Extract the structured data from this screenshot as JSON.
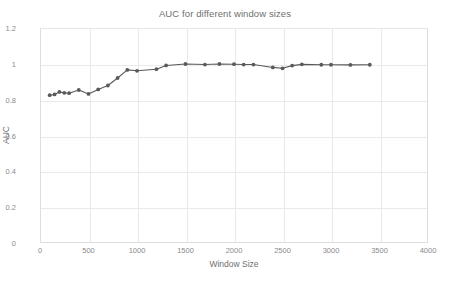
{
  "chart_data": {
    "type": "line",
    "title": "AUC for different window sizes",
    "xlabel": "Window Size",
    "ylabel": "AUC",
    "xlim": [
      0,
      4000
    ],
    "ylim": [
      0,
      1.2
    ],
    "xticks": [
      0,
      500,
      1000,
      1500,
      2000,
      2500,
      3000,
      3500,
      4000
    ],
    "xtick_labels": [
      "0",
      "500",
      "1000",
      "1500",
      "2000",
      "2500",
      "3000",
      "3500",
      "4000"
    ],
    "yticks": [
      0,
      0.2,
      0.4,
      0.6,
      0.8,
      1,
      1.2
    ],
    "ytick_labels": [
      "0",
      "0.2",
      "0.4",
      "0.6",
      "0.8",
      "1",
      "1.2"
    ],
    "grid": true,
    "legend": false,
    "series": [
      {
        "name": "AUC",
        "color": "#595959",
        "marker": "circle",
        "x": [
          100,
          150,
          200,
          250,
          300,
          400,
          500,
          600,
          700,
          800,
          900,
          1000,
          1200,
          1300,
          1500,
          1700,
          1850,
          2000,
          2100,
          2200,
          2400,
          2500,
          2600,
          2700,
          2900,
          3000,
          3200,
          3400
        ],
        "y": [
          0.825,
          0.829,
          0.843,
          0.838,
          0.836,
          0.854,
          0.832,
          0.857,
          0.879,
          0.921,
          0.966,
          0.961,
          0.97,
          0.991,
          0.999,
          0.996,
          0.999,
          0.998,
          0.996,
          0.996,
          0.98,
          0.975,
          0.99,
          0.997,
          0.995,
          0.995,
          0.994,
          0.995
        ]
      }
    ]
  }
}
